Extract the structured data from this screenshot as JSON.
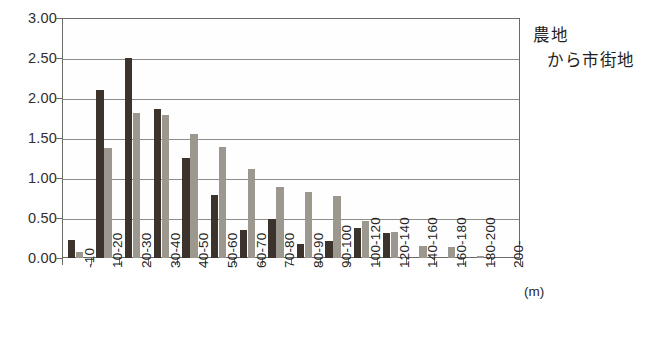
{
  "chart_data": {
    "type": "bar",
    "title": "",
    "subtitle": "",
    "xlabel": "(m)",
    "ylabel": "",
    "ylim": [
      0,
      3.0
    ],
    "ytick_step": 0.5,
    "ytick_labels": [
      "0.00",
      "0.50",
      "1.00",
      "1.50",
      "2.00",
      "2.50",
      "3.00"
    ],
    "ytick_values": [
      0,
      0.5,
      1.0,
      1.5,
      2.0,
      2.5,
      3.0
    ],
    "grid": "horizontal",
    "legend": "none",
    "legend_position": "none",
    "categories": [
      "-10",
      "10-20",
      "20-30",
      "30-40",
      "40-50",
      "50-60",
      "60-70",
      "70-80",
      "80-90",
      "90-100",
      "100-120",
      "120-140",
      "140-160",
      "160-180",
      "180-200",
      "200-"
    ],
    "series": [
      {
        "name": "series-dark",
        "color": "#3b332c",
        "values": [
          0.22,
          2.1,
          2.5,
          1.86,
          1.25,
          0.79,
          0.35,
          0.49,
          0.17,
          0.21,
          0.38,
          0.31,
          0.0,
          0.0,
          0.0,
          0.0
        ]
      },
      {
        "name": "series-gray",
        "color": "#9c9890",
        "values": [
          0.07,
          1.37,
          1.81,
          1.79,
          1.55,
          1.39,
          1.11,
          0.89,
          0.83,
          0.78,
          0.46,
          0.32,
          0.15,
          0.14,
          0.03,
          0.0
        ]
      }
    ],
    "annotation": {
      "line1": "農地",
      "line2": "から市街地"
    }
  },
  "annotation": {
    "line1": "農地",
    "line2": "から市街地"
  },
  "axis": {
    "x_unit": "(m)"
  },
  "caption": {
    "text": ""
  }
}
